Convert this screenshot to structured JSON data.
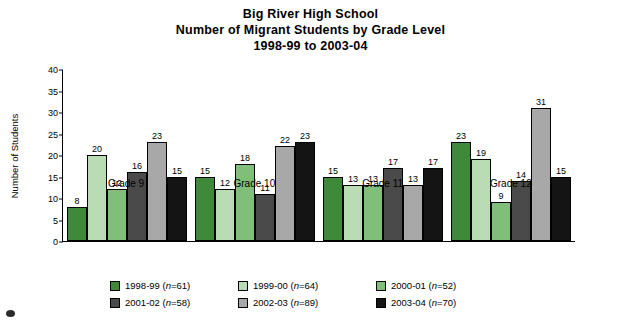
{
  "title": {
    "line1": "Big River High School",
    "line2": "Number of Migrant Students by Grade Level",
    "line3": "1998-99 to 2003-04"
  },
  "axis": {
    "ylabel": "Number of Students",
    "yticks": [
      "0",
      "5",
      "10",
      "15",
      "20",
      "25",
      "30",
      "35",
      "40"
    ]
  },
  "legend": [
    {
      "label": "1998-99 (",
      "n": "n",
      "n_val": "=61)",
      "color": "#3f8a3a"
    },
    {
      "label": "1999-00 (",
      "n": "n",
      "n_val": "=64)",
      "color": "#b9dcb4"
    },
    {
      "label": "2000-01 (",
      "n": "n",
      "n_val": "=52)",
      "color": "#7fbf7a"
    },
    {
      "label": "2001-02 (",
      "n": "n",
      "n_val": "=58)",
      "color": "#4a4a4a"
    },
    {
      "label": "2002-03 (",
      "n": "n",
      "n_val": "=89)",
      "color": "#a8a8a8"
    },
    {
      "label": "2003-04 (",
      "n": "n",
      "n_val": "=70)",
      "color": "#141414"
    }
  ],
  "chart_data": {
    "type": "bar",
    "xlabel": "",
    "ylabel": "Number of Students",
    "ylim": [
      0,
      40
    ],
    "ytick_step": 5,
    "grid": false,
    "legend_position": "bottom",
    "categories": [
      "Grade 9",
      "Grade 10",
      "Grade 11",
      "Grade 12"
    ],
    "series": [
      {
        "name": "1998-99 (n=61)",
        "color": "#3f8a3a",
        "values": [
          8,
          15,
          15,
          23
        ]
      },
      {
        "name": "1999-00 (n=64)",
        "color": "#b9dcb4",
        "values": [
          20,
          12,
          13,
          19
        ]
      },
      {
        "name": "2000-01 (n=52)",
        "color": "#7fbf7a",
        "values": [
          12,
          18,
          13,
          9
        ]
      },
      {
        "name": "2001-02 (n=58)",
        "color": "#4a4a4a",
        "values": [
          16,
          11,
          17,
          14
        ]
      },
      {
        "name": "2002-03 (n=89)",
        "color": "#a8a8a8",
        "values": [
          23,
          22,
          13,
          31
        ]
      },
      {
        "name": "2003-04 (n=70)",
        "color": "#141414",
        "values": [
          15,
          23,
          17,
          15
        ]
      }
    ]
  }
}
